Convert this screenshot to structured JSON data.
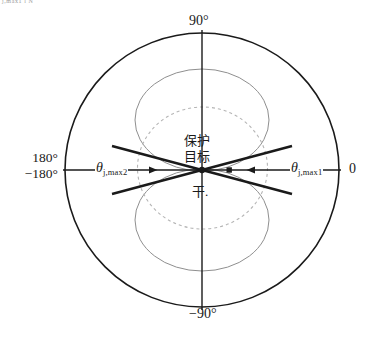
{
  "figure": {
    "corner_fragment": "j,max1 l N",
    "axis": {
      "top_label": "90°",
      "bottom_label": "−90°",
      "left_label_line1": "180°",
      "left_label_line2": "−180°",
      "right_label": "0"
    },
    "angles": {
      "left": {
        "symbol": "θ",
        "subscript": "j,max2"
      },
      "right": {
        "symbol": "θ",
        "subscript": "j,max1"
      }
    },
    "center": {
      "target_line1": "保护",
      "target_line2": "目标",
      "jammer": "干."
    },
    "colors": {
      "stroke": "#1a1a1a",
      "lobe_gray": "#8f8f8f",
      "dashed_gray": "#b5b5b5",
      "background": "#ffffff"
    }
  }
}
